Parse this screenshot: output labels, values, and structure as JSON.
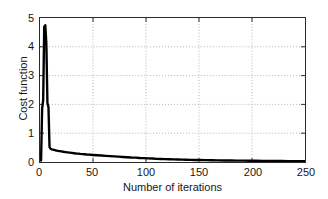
{
  "chart_data": {
    "type": "line",
    "title": "",
    "xlabel": "Number of iterations",
    "ylabel": "Cost function",
    "xlim": [
      0,
      250
    ],
    "ylim": [
      0,
      5
    ],
    "xticks": [
      "0",
      "50",
      "100",
      "150",
      "200",
      "250"
    ],
    "xtick_values": [
      0,
      50,
      100,
      150,
      200,
      250
    ],
    "yticks": [
      "0",
      "1",
      "2",
      "3",
      "4",
      "5"
    ],
    "ytick_values": [
      0,
      1,
      2,
      3,
      4,
      5
    ],
    "grid": "dotted gridlines at x=50,100,150,200 and y=1,2,3,4",
    "legend": "none",
    "line_color": "#000000",
    "series": [
      {
        "name": "Cost function",
        "x": [
          1,
          2,
          3,
          4,
          5,
          6,
          7,
          8,
          9,
          10,
          11,
          12,
          13,
          14,
          15,
          16,
          17,
          18,
          19,
          20,
          22,
          24,
          26,
          28,
          30,
          32,
          34,
          36,
          38,
          40,
          42,
          44,
          46,
          48,
          50,
          54,
          58,
          62,
          66,
          70,
          74,
          78,
          82,
          86,
          90,
          94,
          98,
          102,
          106,
          110,
          114,
          118,
          122,
          126,
          130,
          134,
          138,
          142,
          146,
          150,
          156,
          162,
          168,
          174,
          180,
          186,
          192,
          198,
          204,
          210,
          216,
          222,
          228,
          234,
          240,
          246,
          250
        ],
        "values": [
          0.05,
          1.85,
          2.15,
          4.7,
          4.75,
          4.1,
          2.05,
          1.9,
          0.52,
          0.46,
          0.44,
          0.43,
          0.42,
          0.41,
          0.4,
          0.395,
          0.385,
          0.38,
          0.375,
          0.37,
          0.355,
          0.345,
          0.335,
          0.325,
          0.315,
          0.305,
          0.295,
          0.29,
          0.28,
          0.275,
          0.27,
          0.26,
          0.255,
          0.25,
          0.245,
          0.235,
          0.225,
          0.215,
          0.205,
          0.195,
          0.185,
          0.175,
          0.165,
          0.155,
          0.15,
          0.14,
          0.135,
          0.125,
          0.12,
          0.11,
          0.105,
          0.1,
          0.095,
          0.09,
          0.085,
          0.08,
          0.078,
          0.074,
          0.07,
          0.068,
          0.064,
          0.06,
          0.057,
          0.054,
          0.051,
          0.048,
          0.046,
          0.044,
          0.042,
          0.04,
          0.038,
          0.036,
          0.034,
          0.032,
          0.03,
          0.028,
          0.026
        ],
        "peak_value": 4.75,
        "peak_x": 5,
        "final_value": 0.026
      }
    ]
  },
  "axes": {
    "ylabel": "Cost function",
    "xlabel": "Number of iterations"
  }
}
